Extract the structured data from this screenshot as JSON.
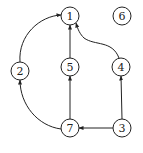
{
  "diagram": {
    "type": "directed-graph",
    "node_radius": 9,
    "colors": {
      "stroke": "#222222",
      "fill": "#ffffff",
      "background": "#ffffff"
    },
    "nodes": [
      {
        "id": "1",
        "label": "1",
        "x": 70,
        "y": 16
      },
      {
        "id": "6",
        "label": "6",
        "x": 122,
        "y": 16
      },
      {
        "id": "2",
        "label": "2",
        "x": 20,
        "y": 71
      },
      {
        "id": "5",
        "label": "5",
        "x": 70,
        "y": 67
      },
      {
        "id": "4",
        "label": "4",
        "x": 121,
        "y": 67
      },
      {
        "id": "7",
        "label": "7",
        "x": 70,
        "y": 128
      },
      {
        "id": "3",
        "label": "3",
        "x": 122,
        "y": 128
      }
    ],
    "edges": [
      {
        "from": "2",
        "to": "1",
        "curved": true
      },
      {
        "from": "5",
        "to": "1",
        "curved": false
      },
      {
        "from": "4",
        "to": "1",
        "curved": true
      },
      {
        "from": "7",
        "to": "2",
        "curved": true
      },
      {
        "from": "7",
        "to": "5",
        "curved": false
      },
      {
        "from": "3",
        "to": "4",
        "curved": false
      },
      {
        "from": "3",
        "to": "7",
        "curved": false
      }
    ]
  }
}
